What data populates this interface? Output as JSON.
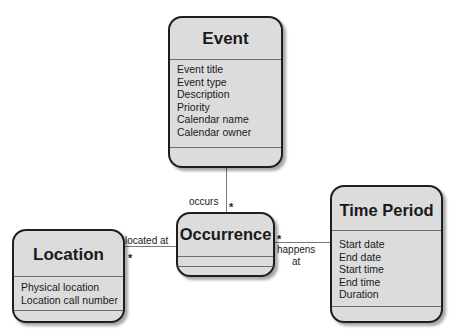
{
  "diagram": {
    "type": "UML class diagram",
    "classes": {
      "event": {
        "name": "Event",
        "attributes": [
          "Event title",
          "Event type",
          "Description",
          "Priority",
          "Calendar name",
          "Calendar owner"
        ]
      },
      "occurrence": {
        "name": "Occurrence",
        "attributes": []
      },
      "location": {
        "name": "Location",
        "attributes": [
          "Physical location",
          "Location call number"
        ]
      },
      "time_period": {
        "name": "Time Period",
        "attributes": [
          "Start date",
          "End date",
          "Start time",
          "End time",
          "Duration"
        ]
      }
    },
    "associations": [
      {
        "from": "Occurrence",
        "to": "Event",
        "label": "occurs",
        "multiplicity": "*"
      },
      {
        "from": "Occurrence",
        "to": "Location",
        "label": "located at",
        "multiplicity": "*"
      },
      {
        "from": "Occurrence",
        "to": "Time Period",
        "label_line1": "happens",
        "label_line2": "at",
        "multiplicity": "*"
      }
    ]
  },
  "colors": {
    "box_fill": "#dcdcdc",
    "box_border": "#1e1e1e",
    "connector": "#7a7a7a"
  }
}
